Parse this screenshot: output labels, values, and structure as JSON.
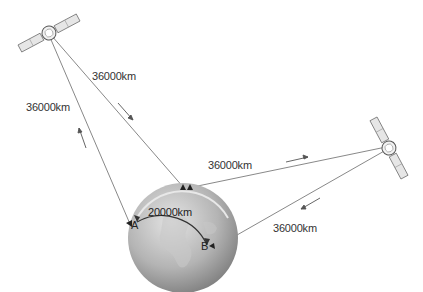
{
  "diagram": {
    "labels": {
      "top_link": "36000km",
      "left_link": "36000km",
      "right_top_link": "36000km",
      "right_bottom_link": "36000km",
      "ground_distance": "20000km",
      "point_a": "A",
      "point_b": "B"
    },
    "colors": {
      "earth_light": "#d6d6d6",
      "earth_dark": "#8a8a8a",
      "line": "#777777",
      "text": "#333333"
    }
  }
}
